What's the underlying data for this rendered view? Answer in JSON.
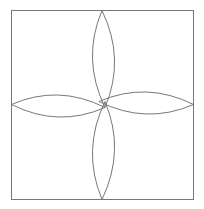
{
  "diagram": {
    "title": "",
    "shapes": {
      "frame": "square",
      "petals": [
        {
          "name": "top",
          "direction": "up"
        },
        {
          "name": "right",
          "direction": "right"
        },
        {
          "name": "bottom",
          "direction": "down"
        },
        {
          "name": "left",
          "direction": "left"
        }
      ],
      "center_motif": "small diamond where petals overlap"
    },
    "colors": {
      "stroke": "#777777",
      "background": "#ffffff"
    }
  }
}
